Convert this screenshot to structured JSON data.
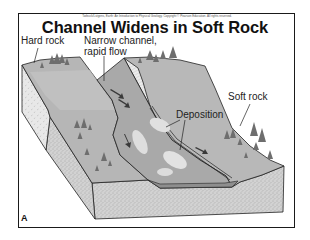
{
  "figure": {
    "copyright_line": "Tarbuck/Lutgens, Earth: An Introduction to Physical Geology. Copyright © Pearson Education. All rights reserved.",
    "title": "Channel Widens in Soft Rock",
    "panel_letter": "A"
  },
  "labels": {
    "hard_rock": "Hard rock",
    "narrow_channel_line1": "Narrow channel,",
    "narrow_channel_line2": "rapid flow",
    "soft_rock": "Soft rock",
    "deposition": "Deposition"
  },
  "colors": {
    "background": "#ffffff",
    "frame": "#1a1a1a",
    "land_surface": "#b4b4b4",
    "upper_terrace": "#c2c2c2",
    "river_water": "#a8a8a8",
    "deposition_bars": "#dedede",
    "hard_rock_face": "#e6e6e6",
    "soft_rock_block": "#d0d0d0",
    "flow_arrows": "#3a3a3a",
    "trees": "#6e6e6e"
  }
}
